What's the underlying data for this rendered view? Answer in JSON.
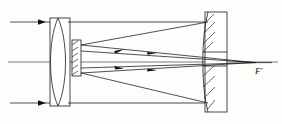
{
  "figure": {
    "type": "optical-ray-diagram",
    "background_color": "#fdfdfc",
    "line_color": "#1a1a1a",
    "width": 282,
    "height": 124
  },
  "labels": {
    "focal_point": "F'",
    "focal_point_x": 258,
    "focal_point_y": 68
  },
  "components": {
    "corrector_lens": {
      "name": "corrector-lens",
      "shape": "biconvex",
      "center_x": 58,
      "top_y": 18,
      "bottom_y": 106
    },
    "lens_cell": {
      "name": "lens-cell-housing",
      "x": 50,
      "y": 18,
      "width": 20,
      "height": 88
    },
    "secondary_mirror": {
      "name": "secondary-mirror",
      "x": 72,
      "y": 40,
      "width": 9,
      "height": 36,
      "hatched": true
    },
    "primary_mirror": {
      "name": "primary-mirror",
      "x": 205,
      "y": 12,
      "width": 22,
      "height": 100,
      "hatched": true,
      "has_central_aperture": true,
      "aperture_top_y": 52,
      "aperture_bottom_y": 66
    },
    "optical_axis": {
      "name": "optical-axis",
      "y": 62,
      "x_start": 8,
      "x_end": 278
    },
    "tube_walls": {
      "name": "telescope-tube",
      "top_y": 22,
      "bottom_y": 103,
      "x_start": 68,
      "x_end": 208
    }
  },
  "rays": {
    "incoming": [
      {
        "name": "incoming-ray-upper",
        "x_start": 10,
        "y": 22,
        "x_end": 50,
        "arrow_x": 40
      },
      {
        "name": "incoming-ray-lower",
        "x_start": 10,
        "y": 103,
        "x_end": 50,
        "arrow_x": 40
      }
    ],
    "to_primary": [
      {
        "name": "ray-tube-to-primary-upper",
        "x1": 68,
        "y1": 22,
        "x2": 208,
        "y2": 22
      },
      {
        "name": "ray-tube-to-primary-lower",
        "x1": 68,
        "y1": 103,
        "x2": 208,
        "y2": 103
      }
    ],
    "reflected_to_secondary": [
      {
        "name": "reflected-ray-upper",
        "x1": 208,
        "y1": 22,
        "x2": 81,
        "y2": 45,
        "arrow_x": 118,
        "arrow_dir": "left"
      },
      {
        "name": "reflected-ray-lower",
        "x1": 208,
        "y1": 103,
        "x2": 81,
        "y2": 73,
        "arrow_x": 118,
        "arrow_dir": "left"
      }
    ],
    "secondary_to_focus": [
      {
        "name": "focus-ray-upper",
        "x1": 81,
        "y1": 45,
        "x2": 254,
        "y2": 63
      },
      {
        "name": "focus-ray-lower",
        "x1": 81,
        "y1": 73,
        "x2": 254,
        "y2": 63
      },
      {
        "name": "focus-ray-upper-arrowed",
        "x1": 81,
        "y1": 50,
        "x2": 254,
        "y2": 63,
        "arrow_x": 150,
        "arrow_dir": "right"
      },
      {
        "name": "focus-ray-lower-arrowed",
        "x1": 81,
        "y1": 68,
        "x2": 254,
        "y2": 63,
        "arrow_x": 150,
        "arrow_dir": "right"
      }
    ]
  }
}
